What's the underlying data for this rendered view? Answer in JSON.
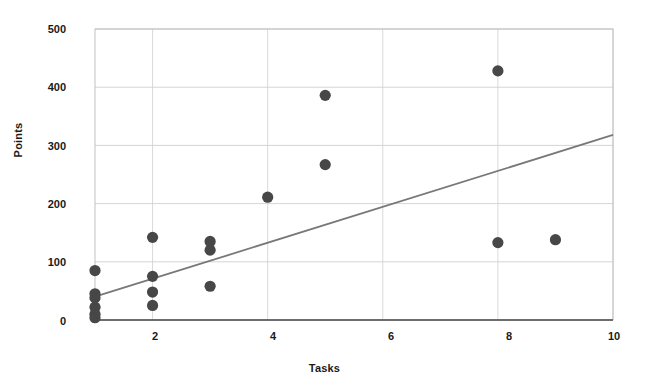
{
  "chart_data": {
    "type": "scatter",
    "title": "",
    "xlabel": "Tasks",
    "ylabel": "Points",
    "xlim": [
      1,
      10
    ],
    "ylim": [
      0,
      500
    ],
    "grid": true,
    "legend": false,
    "xticks": [
      2,
      4,
      6,
      8,
      10
    ],
    "yticks": [
      0,
      100,
      200,
      300,
      400,
      500
    ],
    "point_color": "#474747",
    "trendline_color": "#787878",
    "grid_color": "#c9c9c9",
    "axis_color": "#4a4a4a",
    "points": [
      {
        "x": 1,
        "y": 85
      },
      {
        "x": 1,
        "y": 45
      },
      {
        "x": 1,
        "y": 38
      },
      {
        "x": 1,
        "y": 22
      },
      {
        "x": 1,
        "y": 10
      },
      {
        "x": 1,
        "y": 4
      },
      {
        "x": 2,
        "y": 142
      },
      {
        "x": 2,
        "y": 75
      },
      {
        "x": 2,
        "y": 48
      },
      {
        "x": 2,
        "y": 25
      },
      {
        "x": 3,
        "y": 135
      },
      {
        "x": 3,
        "y": 120
      },
      {
        "x": 3,
        "y": 58
      },
      {
        "x": 4,
        "y": 211
      },
      {
        "x": 5,
        "y": 386
      },
      {
        "x": 5,
        "y": 267
      },
      {
        "x": 8,
        "y": 428
      },
      {
        "x": 8,
        "y": 133
      },
      {
        "x": 9,
        "y": 138
      }
    ],
    "trendline": {
      "x": [
        1,
        10
      ],
      "y": [
        40,
        318
      ]
    }
  },
  "axes": {
    "ytick_labels": [
      "500",
      "400",
      "300",
      "200",
      "100",
      "0"
    ],
    "xtick_labels": [
      "2",
      "4",
      "6",
      "8",
      "10"
    ],
    "y_title": "Points",
    "x_title": "Tasks"
  }
}
